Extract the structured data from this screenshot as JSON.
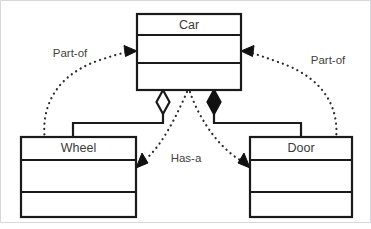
{
  "diagram": {
    "type": "uml-class-diagram",
    "background_color": "#ffffff",
    "line_color": "#1a1a1a",
    "text_color": "#3a3a3a",
    "frame_color": "#d6d8dc",
    "classes": [
      {
        "id": "car",
        "name": "Car",
        "x": 137,
        "y": 14,
        "width": 104,
        "height": 76,
        "compartments": [
          21,
          28,
          27
        ]
      },
      {
        "id": "wheel",
        "name": "Wheel",
        "x": 21,
        "y": 137,
        "width": 115,
        "height": 80,
        "compartments": [
          23,
          32,
          25
        ]
      },
      {
        "id": "door",
        "name": "Door",
        "x": 250,
        "y": 137,
        "width": 102,
        "height": 80,
        "compartments": [
          23,
          32,
          25
        ]
      }
    ],
    "relationships": [
      {
        "id": "part-of-left",
        "label": "Part-of",
        "label_x": 70,
        "label_y": 54,
        "style": "dotted",
        "arrowhead": "filled-triangle",
        "from": "wheel",
        "to": "car"
      },
      {
        "id": "part-of-right",
        "label": "Part-of",
        "label_x": 328,
        "label_y": 61,
        "style": "dotted",
        "arrowhead": "filled-triangle",
        "from": "door",
        "to": "car"
      },
      {
        "id": "has-a",
        "label": "Has-a",
        "label_x": 186,
        "label_y": 159,
        "style": "dotted",
        "arrowhead": "filled-triangle",
        "from": "car",
        "to": "wheel-and-door"
      },
      {
        "id": "aggregation-wheel",
        "label": "",
        "style": "solid",
        "arrowhead": "hollow-diamond",
        "from": "car",
        "to": "wheel"
      },
      {
        "id": "composition-door",
        "label": "",
        "style": "solid",
        "arrowhead": "filled-diamond",
        "from": "car",
        "to": "door"
      }
    ]
  }
}
